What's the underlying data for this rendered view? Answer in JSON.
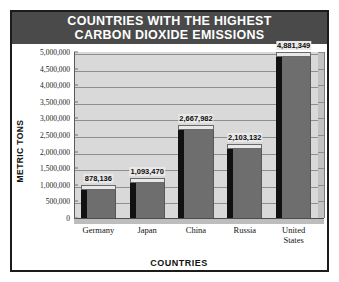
{
  "chart_data": {
    "type": "bar",
    "title": "COUNTRIES WITH THE HIGHEST CARBON DIOXIDE EMISSIONS",
    "title_line1": "COUNTRIES WITH THE HIGHEST",
    "title_line2": "CARBON DIOXIDE EMISSIONS",
    "xlabel": "COUNTRIES",
    "ylabel": "METRIC TONS",
    "categories": [
      "Germany",
      "Japan",
      "China",
      "Russia",
      "United States"
    ],
    "values": [
      878136,
      1093470,
      2667982,
      2103132,
      4881349
    ],
    "value_labels": [
      "878,136",
      "1,093,470",
      "2,667,982",
      "2,103,132",
      "4,881,349"
    ],
    "ylim": [
      0,
      5000000
    ],
    "ytick_values": [
      0,
      500000,
      1000000,
      1500000,
      2000000,
      2500000,
      3000000,
      3500000,
      4000000,
      4500000,
      5000000
    ],
    "ytick_labels": [
      "0",
      "500,000",
      "1,000,000",
      "1,500,000",
      "2,000,000",
      "2,500,000",
      "3,000,000",
      "3,500,000",
      "4,000,000",
      "4,500,000",
      "5,000,000"
    ],
    "grid": true,
    "legend": false,
    "style_3d": true,
    "colors": {
      "title_banner": "#4a4a4a",
      "title_text": "#ffffff",
      "plot_background": "#d9d9d9",
      "bar_front": "#6e6e6e",
      "bar_side": "#111111",
      "bar_top": "#e8e8e8",
      "gridline": "#8e8e8e",
      "border": "#1b1b1b",
      "text": "#111111"
    }
  }
}
